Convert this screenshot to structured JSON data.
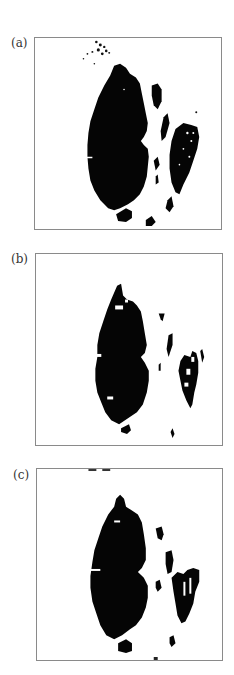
{
  "figure": {
    "panels": [
      {
        "id": "a",
        "label": "(a)",
        "description": "binary segmentation mask, noisy, with white vessel-like gaps"
      },
      {
        "id": "b",
        "label": "(b)",
        "description": "binary segmentation mask, cleaned, small holes"
      },
      {
        "id": "c",
        "label": "(c)",
        "description": "binary segmentation mask, smoothed, separated right fragments"
      }
    ],
    "colors": {
      "foreground": "#000000",
      "background": "#ffffff",
      "frame": "#8a8a8a"
    }
  }
}
